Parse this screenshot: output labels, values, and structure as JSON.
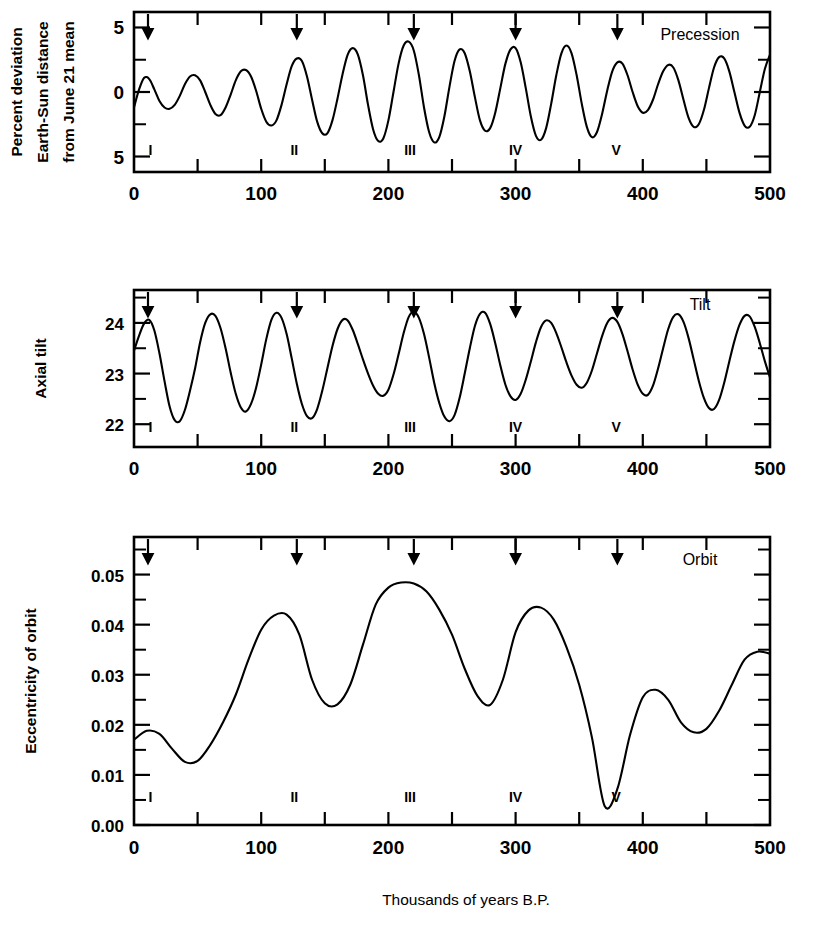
{
  "figure": {
    "xlabel": "Thousands of years B.P.",
    "x_tick_labels": [
      "0",
      "100",
      "200",
      "300",
      "400",
      "500"
    ],
    "x_tick_values": [
      0,
      100,
      200,
      300,
      400,
      500
    ],
    "x_minor_step": 50,
    "xlim": [
      0,
      500
    ],
    "stage_markers": {
      "labels": [
        "I",
        "II",
        "III",
        "IV",
        "V"
      ],
      "positions": [
        13,
        126,
        217,
        300,
        379
      ]
    },
    "arrow_positions": [
      11,
      128,
      220,
      300,
      380
    ]
  },
  "chart_data": [
    {
      "type": "line",
      "panel": "precession",
      "title": "Precession",
      "ylabel": "Percent deviation Earth-Sun distance from June 21 mean",
      "ylabel_lines": [
        "Percent deviation",
        "Earth-Sun distance",
        "from June 21 mean"
      ],
      "xlabel": "Thousands of years B.P.",
      "xlim": [
        0,
        500
      ],
      "ylim": [
        -6.2,
        6.2
      ],
      "y_tick_values": [
        5,
        0,
        -5
      ],
      "y_tick_labels": [
        "5",
        "0",
        "5"
      ],
      "y_minor_values": [
        2.5,
        -2.5
      ],
      "grid": false,
      "x": [
        0,
        4,
        8,
        12,
        16,
        20,
        24,
        28,
        32,
        36,
        40,
        44,
        48,
        52,
        56,
        60,
        64,
        68,
        72,
        76,
        80,
        84,
        88,
        92,
        96,
        100,
        104,
        108,
        112,
        116,
        120,
        124,
        128,
        132,
        136,
        140,
        144,
        148,
        152,
        156,
        160,
        164,
        168,
        172,
        176,
        180,
        184,
        188,
        192,
        196,
        200,
        204,
        208,
        212,
        216,
        220,
        224,
        228,
        232,
        236,
        240,
        244,
        248,
        252,
        256,
        260,
        264,
        268,
        272,
        276,
        280,
        284,
        288,
        292,
        296,
        300,
        304,
        308,
        312,
        316,
        320,
        324,
        328,
        332,
        336,
        340,
        344,
        348,
        352,
        356,
        360,
        364,
        368,
        372,
        376,
        380,
        384,
        388,
        392,
        396,
        400,
        404,
        408,
        412,
        416,
        420,
        424,
        428,
        432,
        436,
        440,
        444,
        448,
        452,
        456,
        460,
        464,
        468,
        472,
        476,
        480,
        484,
        488,
        492,
        496,
        500
      ],
      "y": [
        -1.2,
        0.2,
        1.1,
        1.0,
        0.2,
        -0.7,
        -1.2,
        -1.3,
        -1.0,
        -0.3,
        0.6,
        1.2,
        1.3,
        0.9,
        0.0,
        -1.0,
        -1.7,
        -1.8,
        -1.2,
        -0.2,
        0.9,
        1.6,
        1.7,
        1.2,
        0.1,
        -1.3,
        -2.3,
        -2.6,
        -2.2,
        -1.0,
        0.6,
        2.0,
        2.6,
        2.4,
        1.2,
        -0.6,
        -2.3,
        -3.2,
        -3.2,
        -2.2,
        -0.5,
        1.4,
        2.9,
        3.4,
        2.9,
        1.3,
        -1.0,
        -2.9,
        -3.8,
        -3.6,
        -2.2,
        0.0,
        2.2,
        3.6,
        3.9,
        3.2,
        1.3,
        -1.2,
        -3.1,
        -3.9,
        -3.5,
        -1.9,
        0.4,
        2.4,
        3.3,
        3.0,
        1.6,
        -0.4,
        -2.2,
        -3.0,
        -2.8,
        -1.6,
        0.3,
        2.2,
        3.3,
        3.4,
        2.3,
        0.3,
        -1.9,
        -3.4,
        -3.7,
        -2.8,
        -0.9,
        1.3,
        3.0,
        3.6,
        3.0,
        1.3,
        -0.9,
        -2.7,
        -3.5,
        -3.1,
        -1.7,
        0.1,
        1.6,
        2.3,
        2.2,
        1.3,
        0.0,
        -1.1,
        -1.6,
        -1.4,
        -0.6,
        0.6,
        1.6,
        2.1,
        1.9,
        0.9,
        -0.6,
        -2.0,
        -2.7,
        -2.5,
        -1.4,
        0.3,
        1.9,
        2.7,
        2.6,
        1.6,
        0.0,
        -1.6,
        -2.6,
        -2.7,
        -1.8,
        0.0,
        1.8,
        2.9,
        3.0,
        1.6,
        -0.6,
        -3.0,
        -4.6
      ]
    },
    {
      "type": "line",
      "panel": "tilt",
      "title": "Tilt",
      "ylabel": "Axial tilt",
      "xlabel": "Thousands of years B.P.",
      "xlim": [
        0,
        500
      ],
      "ylim": [
        21.55,
        24.65
      ],
      "y_tick_values": [
        24,
        23,
        22
      ],
      "y_tick_labels": [
        "24",
        "23",
        "22"
      ],
      "y_minor_values": [
        24.5,
        23.5,
        22.5
      ],
      "grid": false,
      "x": [
        0,
        4,
        8,
        12,
        16,
        20,
        24,
        28,
        32,
        36,
        40,
        44,
        48,
        52,
        56,
        60,
        64,
        68,
        72,
        76,
        80,
        84,
        88,
        92,
        96,
        100,
        104,
        108,
        112,
        116,
        120,
        124,
        128,
        132,
        136,
        140,
        144,
        148,
        152,
        156,
        160,
        164,
        168,
        172,
        176,
        180,
        184,
        188,
        192,
        196,
        200,
        204,
        208,
        212,
        216,
        220,
        224,
        228,
        232,
        236,
        240,
        244,
        248,
        252,
        256,
        260,
        264,
        268,
        272,
        276,
        280,
        284,
        288,
        292,
        296,
        300,
        304,
        308,
        312,
        316,
        320,
        324,
        328,
        332,
        336,
        340,
        344,
        348,
        352,
        356,
        360,
        364,
        368,
        372,
        376,
        380,
        384,
        388,
        392,
        396,
        400,
        404,
        408,
        412,
        416,
        420,
        424,
        428,
        432,
        436,
        440,
        444,
        448,
        452,
        456,
        460,
        464,
        468,
        472,
        476,
        480,
        484,
        488,
        492,
        496,
        500
      ],
      "y": [
        23.45,
        23.75,
        23.99,
        24.06,
        23.85,
        23.4,
        22.85,
        22.35,
        22.08,
        22.06,
        22.28,
        22.66,
        23.1,
        23.62,
        24.0,
        24.17,
        24.14,
        23.9,
        23.5,
        23.02,
        22.6,
        22.33,
        22.25,
        22.4,
        22.72,
        23.18,
        23.68,
        24.06,
        24.2,
        24.1,
        23.78,
        23.3,
        22.8,
        22.4,
        22.16,
        22.12,
        22.3,
        22.66,
        23.1,
        23.54,
        23.88,
        24.06,
        24.05,
        23.86,
        23.58,
        23.28,
        23.0,
        22.76,
        22.6,
        22.56,
        22.68,
        22.98,
        23.38,
        23.8,
        24.12,
        24.22,
        24.1,
        23.78,
        23.32,
        22.82,
        22.42,
        22.15,
        22.06,
        22.18,
        22.52,
        23.0,
        23.5,
        23.94,
        24.18,
        24.2,
        23.98,
        23.6,
        23.16,
        22.78,
        22.55,
        22.48,
        22.6,
        22.88,
        23.24,
        23.62,
        23.92,
        24.05,
        24.0,
        23.8,
        23.52,
        23.22,
        22.96,
        22.78,
        22.72,
        22.82,
        23.06,
        23.4,
        23.74,
        24.0,
        24.1,
        24.02,
        23.78,
        23.44,
        23.08,
        22.78,
        22.6,
        22.58,
        22.76,
        23.1,
        23.5,
        23.88,
        24.12,
        24.17,
        24.02,
        23.7,
        23.28,
        22.86,
        22.52,
        22.32,
        22.3,
        22.48,
        22.82,
        23.24,
        23.64,
        23.96,
        24.14,
        24.13,
        23.92,
        23.6,
        23.24,
        22.92,
        22.7,
        22.62
      ]
    },
    {
      "type": "line",
      "panel": "orbit",
      "title": "Orbit",
      "ylabel": "Eccentricity of orbit",
      "xlabel": "Thousands of years B.P.",
      "xlim": [
        0,
        500
      ],
      "ylim": [
        0.0,
        0.0575
      ],
      "y_tick_values": [
        0.05,
        0.04,
        0.03,
        0.02,
        0.01,
        0.0
      ],
      "y_tick_labels": [
        "0.05",
        "0.04",
        "0.03",
        "0.02",
        "0.01",
        "0.00"
      ],
      "y_minor_values": [
        0.055,
        0.045,
        0.035,
        0.025,
        0.015,
        0.005
      ],
      "grid": false,
      "x": [
        0,
        10,
        20,
        30,
        40,
        50,
        60,
        70,
        80,
        90,
        100,
        110,
        120,
        130,
        140,
        150,
        160,
        170,
        180,
        190,
        200,
        210,
        220,
        230,
        240,
        250,
        260,
        270,
        280,
        290,
        300,
        310,
        320,
        330,
        340,
        350,
        360,
        370,
        380,
        390,
        400,
        410,
        420,
        430,
        440,
        450,
        460,
        470,
        480,
        490,
        500
      ],
      "y": [
        0.017,
        0.0188,
        0.0182,
        0.0152,
        0.0126,
        0.0128,
        0.016,
        0.0205,
        0.026,
        0.033,
        0.039,
        0.0418,
        0.042,
        0.038,
        0.029,
        0.0243,
        0.0241,
        0.028,
        0.036,
        0.044,
        0.0474,
        0.0484,
        0.0482,
        0.0466,
        0.043,
        0.038,
        0.0312,
        0.0258,
        0.024,
        0.029,
        0.0385,
        0.0428,
        0.0434,
        0.041,
        0.0355,
        0.028,
        0.0175,
        0.0038,
        0.0072,
        0.018,
        0.0255,
        0.027,
        0.025,
        0.0205,
        0.0185,
        0.0192,
        0.0228,
        0.028,
        0.033,
        0.0346,
        0.0342
      ]
    }
  ]
}
